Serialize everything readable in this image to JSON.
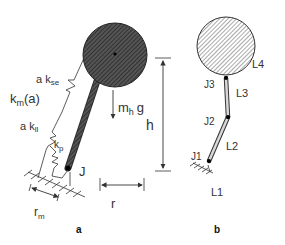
{
  "panel_a": {
    "caption": "a",
    "labels": {
      "a_kse": "a k",
      "a_kse_sub": "se",
      "km": "k",
      "km_sub": "m",
      "km_arg": "(a)",
      "a_kll": "a k",
      "a_kll_sub": "ll",
      "kp": "k",
      "kp_sub": "p",
      "mh": "m",
      "mh_sub": "h",
      "g": "g",
      "h": "h",
      "J": "J",
      "rm": "r",
      "rm_sub": "m",
      "r": "r"
    },
    "colors": {
      "body_fill": "#3a3a3a",
      "line": "#333333"
    }
  },
  "panel_b": {
    "caption": "b",
    "labels": {
      "J1": "J1",
      "J2": "J2",
      "J3": "J3",
      "L1": "L1",
      "L2": "L2",
      "L3": "L3",
      "L4": "L4"
    },
    "colors": {
      "body_fill": "#bbbbbb",
      "line": "#333333"
    }
  }
}
